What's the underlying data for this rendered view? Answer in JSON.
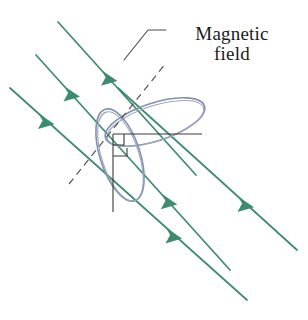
{
  "figure": {
    "width": 308,
    "height": 320,
    "background": "#ffffff"
  },
  "annotations": {
    "field_label": {
      "line1": "Magnetic",
      "line2": "field",
      "full_text": "Magnetic field",
      "font_style": "serif",
      "color": "#1a1a1a"
    }
  },
  "colors": {
    "field_line_green": "#3c8c6e",
    "field_line_green_light": "#55a085",
    "coil_blue_gray": "#8390ad",
    "coil_blue_gray_dark": "#6b7a99",
    "axis_black": "#3a3a3a",
    "dashed_gray": "#555555",
    "leader_gray": "#4a4a4a",
    "background": "#ffffff"
  },
  "elements": {
    "field_lines": {
      "name": "magnetic-field-lines",
      "count": 4,
      "direction": "down-right",
      "angle_degrees": 48,
      "arrowheads_per_line": 1,
      "color": "#3c8c6e",
      "lines": [
        {
          "id": 1,
          "x1": 58,
          "y1": 22,
          "x2": 196,
          "y2": 175,
          "arrow_t": 0.45
        },
        {
          "id": 2,
          "x1": 36,
          "y1": 55,
          "x2": 230,
          "y2": 270,
          "arrow_t": 0.32
        },
        {
          "id": 3,
          "x1": 10,
          "y1": 88,
          "x2": 247,
          "y2": 300,
          "arrow_t": 0.22
        },
        {
          "id": 4,
          "x1": 118,
          "y1": 88,
          "x2": 297,
          "y2": 250,
          "arrow_t": 0.82
        }
      ]
    },
    "coil": {
      "name": "wire-coil",
      "description": "two intersecting elliptical loops forming a tilted circular coil",
      "stroke_color": "#8390ad",
      "lobes": [
        {
          "id": "upper-right-lobe",
          "cx": 155,
          "cy": 122,
          "rx": 52,
          "ry": 19,
          "rotation": -18
        },
        {
          "id": "lower-left-lobe",
          "cx": 120,
          "cy": 155,
          "rx": 48,
          "ry": 20,
          "rotation": 72
        }
      ]
    },
    "normal_axis": {
      "name": "dashed-normal-line",
      "style": "dashed",
      "x1": 69,
      "y1": 184,
      "x2": 166,
      "y2": 63,
      "color": "#555555"
    },
    "horizontal_axis": {
      "name": "horizontal-axis-line",
      "x1": 113,
      "y1": 134,
      "x2": 202,
      "y2": 134,
      "color": "#3a3a3a"
    },
    "vertical_axis": {
      "name": "vertical-axis-line",
      "x1": 113,
      "y1": 134,
      "x2": 113,
      "y2": 212,
      "color": "#3a3a3a"
    },
    "right_angle_markers": {
      "name": "right-angle-markers",
      "count": 2,
      "size": 11,
      "color": "#3a3a3a"
    },
    "leader_line": {
      "name": "label-leader-line",
      "points": "166,30 148,30 124,60",
      "color": "#4a4a4a"
    }
  }
}
